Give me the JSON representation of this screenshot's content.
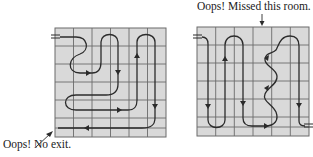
{
  "figure": {
    "grid_size": {
      "rows": 6,
      "cols": 6
    },
    "colors": {
      "cell_fill": "#d9d9d9",
      "grid_line": "#6b6b6b",
      "path": "#2b2b2b",
      "text": "#1a1a1a"
    }
  },
  "left_panel": {
    "annotation": "Oops! No exit.",
    "entrance": "top-left",
    "problem": "path ends at bottom-left with no exit"
  },
  "right_panel": {
    "annotation": "Oops! Missed this room.",
    "entrance": "top-left",
    "exit": "bottom-right",
    "problem": "one room in top row missed"
  }
}
